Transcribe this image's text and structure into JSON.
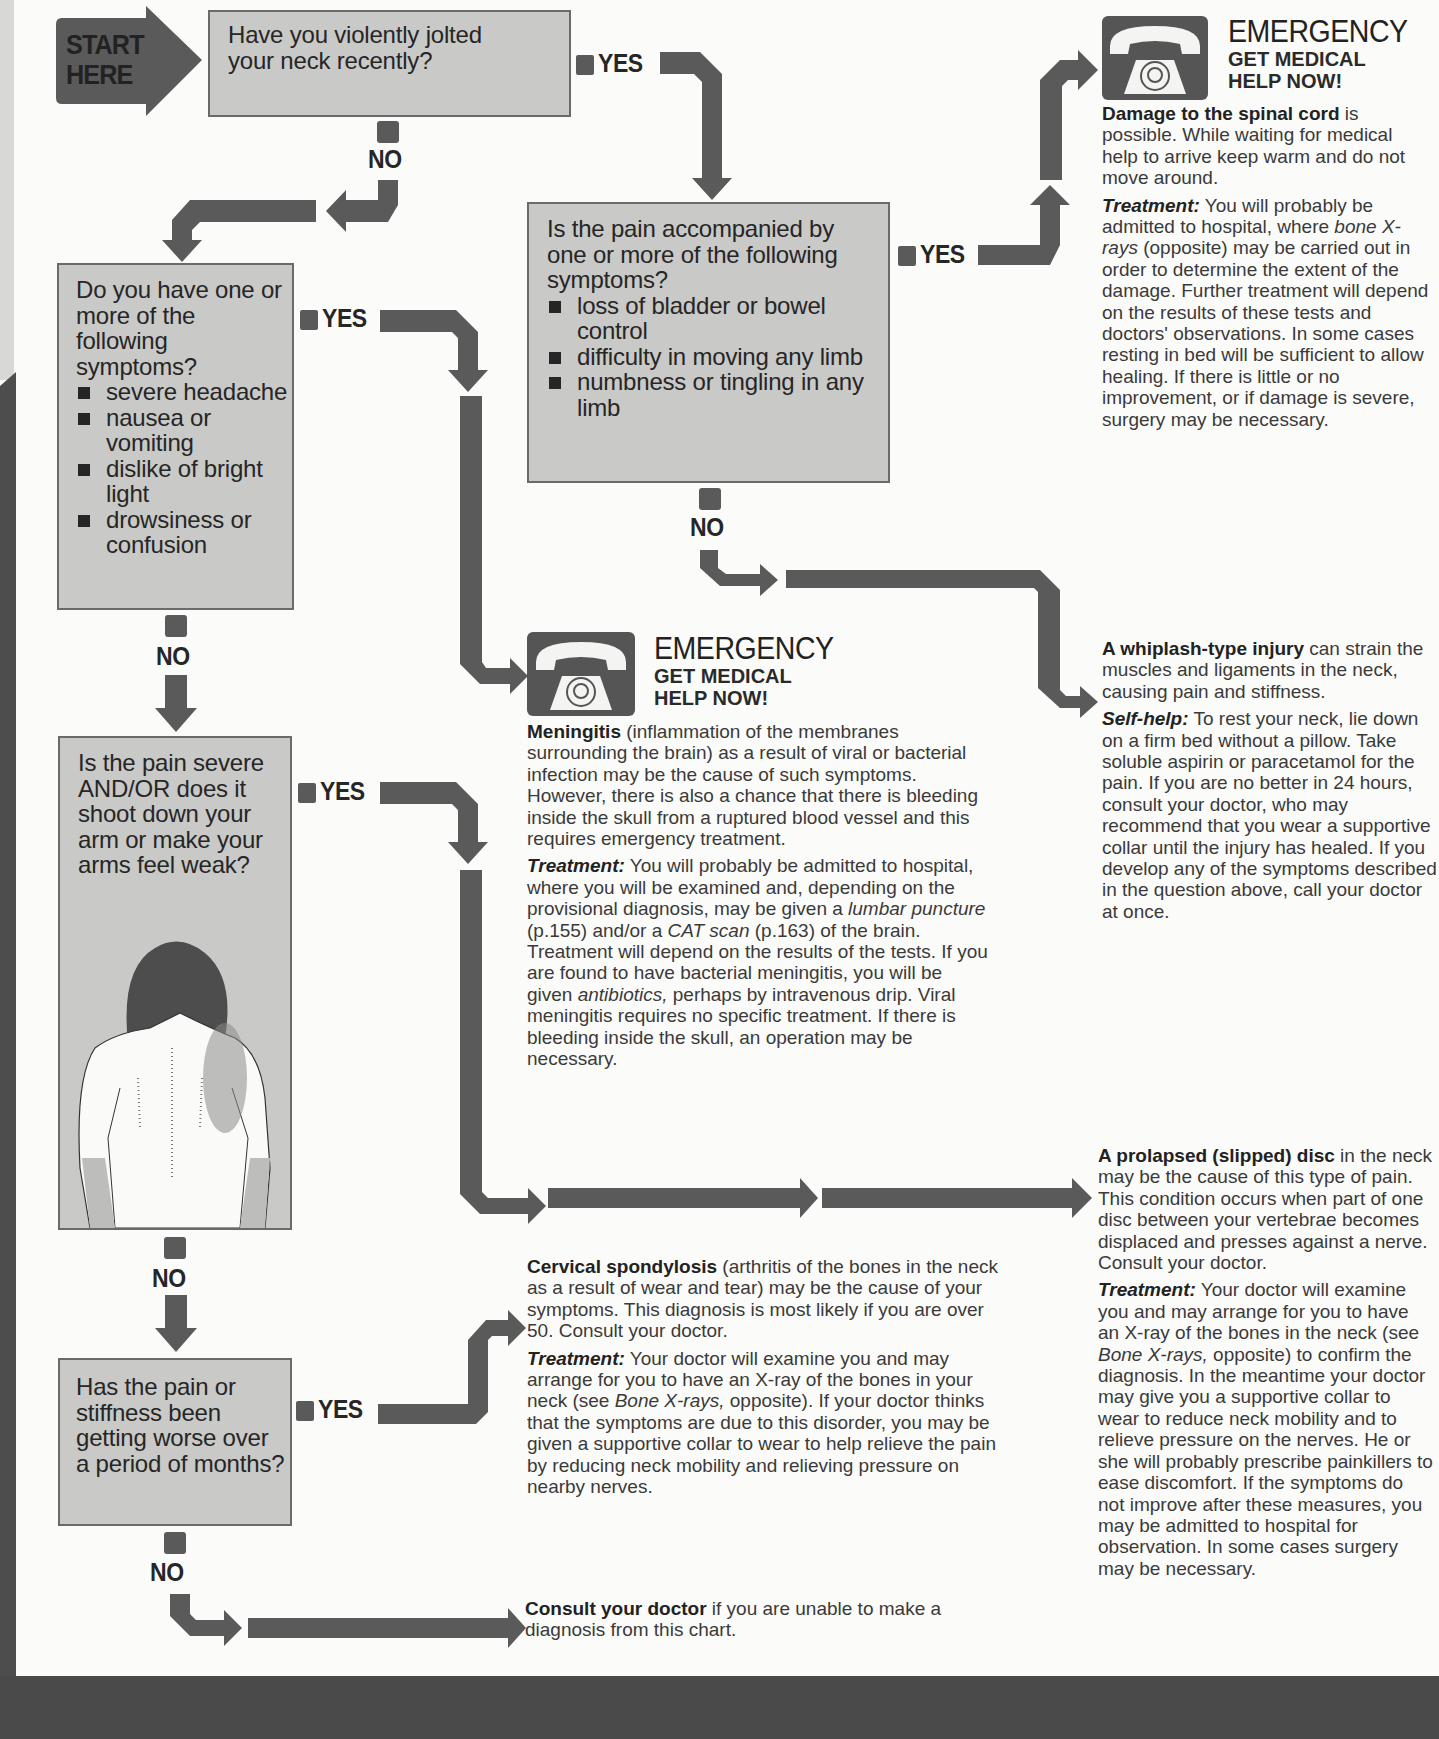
{
  "start": {
    "line1": "START",
    "line2": "HERE"
  },
  "labels": {
    "yes": "YES",
    "no": "NO"
  },
  "questions": {
    "q1": {
      "text": "Have you violently jolted your neck recently?"
    },
    "q2": {
      "text": "Do you have one or more of the following symptoms?",
      "items": [
        "severe headache",
        "nausea or vomiting",
        "dislike of bright light",
        "drowsiness or confusion"
      ]
    },
    "q3": {
      "text": "Is the pain accompanied by one or more of the following symptoms?",
      "items": [
        "loss of bladder or bowel control",
        "difficulty in moving any limb",
        "numbness or tingling in any limb"
      ]
    },
    "q4": {
      "text": "Is the pain severe AND/OR does it shoot down your arm or make your arms feel weak?"
    },
    "q5": {
      "text": "Has the pain or stiffness been getting worse over a period of months?"
    }
  },
  "emergency": {
    "title": "EMERGENCY",
    "subtitle_line1": "GET MEDICAL",
    "subtitle_line2": "HELP NOW!"
  },
  "outcomes": {
    "spinal": {
      "lead_bold": "Damage to the spinal cord",
      "lead_rest": " is possible. While waiting for medical help to arrive keep warm and do not move around.",
      "treatment_label": "Treatment:",
      "treatment_a": " You will probably be admitted to hospital, where ",
      "treatment_italic": "bone X-rays",
      "treatment_b": " (opposite) may be carried out in order to determine the extent of the damage. Further treatment will depend on the results of these tests and doctors' observations. In some cases resting in bed will be sufficient to allow healing. If there is little or no improvement, or if damage is severe, surgery may be necessary."
    },
    "meningitis": {
      "lead_bold": "Meningitis",
      "lead_rest": " (inflammation of the membranes surrounding the brain) as a result of viral or bacterial infection may be the cause of such symptoms. However, there is also a chance that there is bleeding inside the skull from a ruptured blood vessel and this requires emergency treatment.",
      "treatment_label": "Treatment:",
      "treatment_a": " You will probably be admitted to hospital, where you will be examined and, depending on the provisional diagnosis, may be given a ",
      "treatment_i1": "lumbar puncture",
      "treatment_b": " (p.155) and/or a ",
      "treatment_i2": "CAT scan",
      "treatment_c": " (p.163) of the brain. Treatment will depend on the results of the tests. If you are found to have bacterial meningitis, you will be given ",
      "treatment_i3": "antibiotics,",
      "treatment_d": " perhaps by intravenous drip. Viral meningitis requires no specific treatment. If there is bleeding inside the skull, an operation may be necessary."
    },
    "whiplash": {
      "lead_bold": "A whiplash-type injury",
      "lead_rest": " can strain the muscles and ligaments in the neck, causing pain and stiffness.",
      "selfhelp_label": "Self-help:",
      "selfhelp_text": " To rest your neck, lie down on a firm bed without a pillow. Take soluble aspirin or paracetamol for the pain. If you are no better in 24 hours, consult your doctor, who may recommend that you wear a supportive collar until the injury has healed. If you develop any of the symptoms described in the question above, call your doctor at once."
    },
    "prolapsed": {
      "lead_bold": "A prolapsed (slipped) disc",
      "lead_rest": " in the neck may be the cause of this type of pain. This condition occurs when part of one disc between your vertebrae becomes displaced and presses against a nerve. Consult your doctor.",
      "treatment_label": "Treatment:",
      "treatment_a": " Your doctor will examine you and may arrange for you to have an X-ray of the bones in the neck (see ",
      "treatment_italic": "Bone X-rays,",
      "treatment_b": " opposite) to confirm the diagnosis. In the meantime your doctor may give you a supportive collar to wear to reduce neck mobility and to relieve pressure on the nerves. He or she will probably prescribe painkillers to ease discomfort. If the symptoms do not improve after these measures, you may be admitted to hospital for observation. In some cases surgery may be necessary."
    },
    "spondylosis": {
      "lead_bold": "Cervical spondylosis",
      "lead_rest": " (arthritis of the bones in the neck as a result of wear and tear) may be the cause of your symptoms. This diagnosis is most likely if you are over 50. Consult your doctor.",
      "treatment_label": "Treatment:",
      "treatment_a": " Your doctor will examine you and may arrange for you to have an X-ray of the bones in your neck (see ",
      "treatment_italic": "Bone X-rays,",
      "treatment_b": " opposite). If your doctor thinks that the symptoms are due to this disorder, you may be given a supportive collar to wear to help relieve the pain by reducing neck mobility and relieving pressure on nearby nerves."
    },
    "consult": {
      "lead_bold": "Consult your doctor",
      "lead_rest": " if you are unable to make a diagnosis from this chart."
    }
  },
  "colors": {
    "page": "#fbfbf9",
    "box_fill": "#c9c9c7",
    "arrow": "#5a5a5a",
    "band": "#4a4a4a",
    "text": "#2a2a2a"
  }
}
